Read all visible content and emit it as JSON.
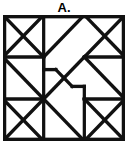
{
  "figure": {
    "label": "A.",
    "type": "geometric-pattern-tile",
    "colors": {
      "stroke": "#111111",
      "fill": "#ffffff",
      "background": "#ffffff"
    },
    "geometry": {
      "viewbox": "0 0 120 120",
      "stroke_width": 3.2,
      "grid_divisions": 3,
      "cell_size": 40,
      "border": {
        "x": 0,
        "y": 0,
        "width": 120,
        "height": 120
      },
      "segments": [
        [
          0,
          0,
          40,
          40
        ],
        [
          40,
          0,
          0,
          40
        ],
        [
          0,
          40,
          40,
          80
        ],
        [
          0,
          40,
          40,
          40
        ],
        [
          40,
          0,
          40,
          80
        ],
        [
          40,
          40,
          80,
          0
        ],
        [
          40,
          80,
          80,
          40
        ],
        [
          80,
          0,
          120,
          40
        ],
        [
          120,
          0,
          80,
          40
        ],
        [
          80,
          40,
          120,
          40
        ],
        [
          80,
          40,
          120,
          80
        ],
        [
          40,
          80,
          0,
          120
        ],
        [
          0,
          80,
          40,
          120
        ],
        [
          0,
          80,
          40,
          80
        ],
        [
          40,
          80,
          40,
          120
        ],
        [
          40,
          80,
          80,
          120
        ],
        [
          80,
          120,
          120,
          80
        ],
        [
          80,
          80,
          120,
          120
        ],
        [
          80,
          80,
          120,
          80
        ],
        [
          80,
          80,
          80,
          120
        ],
        [
          40,
          40,
          40,
          52
        ],
        [
          40,
          52,
          52,
          52
        ],
        [
          52,
          52,
          60,
          60
        ],
        [
          60,
          60,
          68,
          68
        ],
        [
          68,
          68,
          80,
          68
        ],
        [
          80,
          68,
          80,
          80
        ]
      ]
    }
  }
}
